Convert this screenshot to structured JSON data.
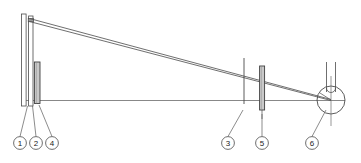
{
  "figure": {
    "type": "technical-line-drawing",
    "title": "",
    "background_color": "#ffffff",
    "line_color": "#404040",
    "fill_gray": "#b5b5b5",
    "fill_light": "#d8d8d8",
    "width": 361,
    "height": 163
  },
  "callouts": [
    {
      "id": "1",
      "label": "1",
      "cx": 20,
      "cy": 143,
      "r": 6.5,
      "leader_to_x": 28,
      "leader_to_y": 108
    },
    {
      "id": "2",
      "label": "2",
      "cx": 36,
      "cy": 143,
      "r": 6.5,
      "leader_to_x": 33,
      "leader_to_y": 108
    },
    {
      "id": "3",
      "label": "3",
      "cx": 228,
      "cy": 143,
      "r": 6.5,
      "leader_to_x": 243,
      "leader_to_y": 112
    },
    {
      "id": "4",
      "label": "4",
      "cx": 52,
      "cy": 143,
      "r": 6.5,
      "leader_to_x": 40,
      "leader_to_y": 108
    },
    {
      "id": "5",
      "label": "5",
      "cx": 262,
      "cy": 143,
      "r": 6.5,
      "leader_to_x": 263,
      "leader_to_y": 116
    },
    {
      "id": "6",
      "label": "6",
      "cx": 312,
      "cy": 143,
      "r": 6.5,
      "leader_to_x": 327,
      "leader_to_y": 110
    }
  ],
  "parts": {
    "mast_outer": {
      "name": "mast-outer-column",
      "x": 21.5,
      "y": 14,
      "width": 4.5,
      "height": 92
    },
    "mast_inner": {
      "name": "mast-inner-column",
      "x": 28.5,
      "y": 16,
      "width": 4.5,
      "height": 90
    },
    "slider_block": {
      "name": "slider-block",
      "x": 34.5,
      "y": 62,
      "width": 5.5,
      "height": 41
    },
    "post_3": {
      "name": "vertical-post-3",
      "x": 243.5,
      "y": 58,
      "height": 46
    },
    "block_5": {
      "name": "guide-block-5",
      "x": 259.5,
      "y": 66,
      "width": 5,
      "height": 44
    },
    "pulley": {
      "name": "pulley-wheel",
      "cx": 331,
      "cy": 100,
      "r": 14
    },
    "pulley_channel": {
      "name": "pulley-channel",
      "x": 325,
      "y": 62,
      "width": 11,
      "height": 38
    },
    "baseline": {
      "name": "horizontal-datum-line",
      "x1": 23,
      "y1": 100,
      "x2": 345,
      "y2": 100
    },
    "cable_upper": {
      "name": "cable-line-upper",
      "x1": 30,
      "y1": 20,
      "x2": 331,
      "y2": 100
    },
    "cable_lower": {
      "name": "cable-line-lower",
      "x1": 30,
      "y1": 21,
      "x2": 331,
      "y2": 100
    }
  }
}
